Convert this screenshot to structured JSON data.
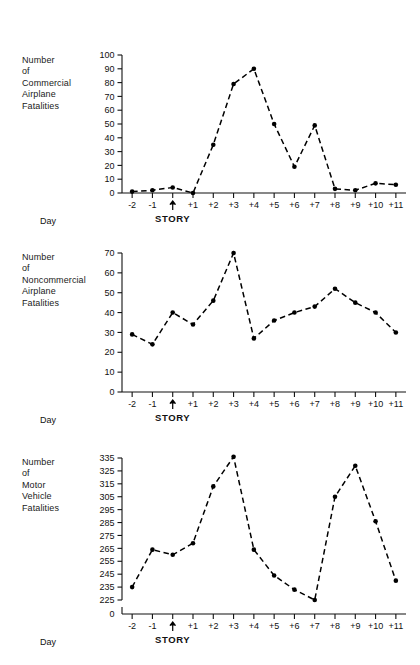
{
  "figure": {
    "x_axis_title": "Day",
    "story_marker_label": "STORY",
    "story_marker_icon": "up-arrow-icon",
    "categories": [
      "-2",
      "-1",
      "0",
      "+1",
      "+2",
      "+3",
      "+4",
      "+5",
      "+6",
      "+7",
      "+8",
      "+9",
      "+10",
      "+11"
    ],
    "tick_labels": [
      "-2",
      "-1",
      "↑",
      "+1",
      "+2",
      "+3",
      "+4",
      "+5",
      "+6",
      "+7",
      "+8",
      "+9",
      "+10",
      "+11"
    ],
    "line_color": "#000000",
    "marker_color": "#000000",
    "axis_color": "#111111",
    "background": "#ffffff"
  },
  "chart_data": [
    {
      "type": "line",
      "id": "commercial-airplane-fatalities",
      "title": "",
      "ylabel_lines": [
        "Number",
        "of",
        "Commercial",
        "Airplane",
        "Fatalities"
      ],
      "ylabel": "Number of Commercial Airplane Fatalities",
      "xlabel": "Day",
      "categories": [
        "-2",
        "-1",
        "0",
        "+1",
        "+2",
        "+3",
        "+4",
        "+5",
        "+6",
        "+7",
        "+8",
        "+9",
        "+10",
        "+11"
      ],
      "values": [
        1,
        2,
        4,
        0,
        35,
        79,
        90,
        50,
        19,
        49,
        3,
        2,
        7,
        6
      ],
      "yticks": [
        0,
        10,
        20,
        30,
        40,
        50,
        60,
        70,
        80,
        90,
        100
      ],
      "ytick_labels": [
        "0",
        "10",
        "20",
        "30",
        "40",
        "50",
        "60",
        "70",
        "80",
        "90",
        "100"
      ],
      "ylim": [
        0,
        100
      ],
      "axis_break": false,
      "grid": false,
      "legend": "none",
      "linestyle": "dashed",
      "annotations": [
        {
          "x": "0",
          "text": "STORY",
          "marker": "up-arrow-icon"
        }
      ]
    },
    {
      "type": "line",
      "id": "noncommercial-airplane-fatalities",
      "title": "",
      "ylabel_lines": [
        "Number",
        "of",
        "Noncommercial",
        "Airplane",
        "Fatalities"
      ],
      "ylabel": "Number of Noncommercial Airplane Fatalities",
      "xlabel": "Day",
      "categories": [
        "-2",
        "-1",
        "0",
        "+1",
        "+2",
        "+3",
        "+4",
        "+5",
        "+6",
        "+7",
        "+8",
        "+9",
        "+10",
        "+11"
      ],
      "values": [
        29,
        24,
        40,
        34,
        46,
        70,
        27,
        36,
        40,
        43,
        52,
        45,
        40,
        30
      ],
      "yticks": [
        0,
        10,
        20,
        30,
        40,
        50,
        60,
        70
      ],
      "ytick_labels": [
        "0",
        "10",
        "20",
        "30",
        "40",
        "50",
        "60",
        "70"
      ],
      "ylim": [
        0,
        70
      ],
      "axis_break": false,
      "grid": false,
      "legend": "none",
      "linestyle": "dashed",
      "annotations": [
        {
          "x": "0",
          "text": "STORY",
          "marker": "up-arrow-icon"
        }
      ]
    },
    {
      "type": "line",
      "id": "motor-vehicle-fatalities",
      "title": "",
      "ylabel_lines": [
        "Number",
        "of",
        "Motor",
        "Vehicle",
        "Fatalities"
      ],
      "ylabel": "Number of Motor Vehicle Fatalities",
      "xlabel": "Day",
      "categories": [
        "-2",
        "-1",
        "0",
        "+1",
        "+2",
        "+3",
        "+4",
        "+5",
        "+6",
        "+7",
        "+8",
        "+9",
        "+10",
        "+11"
      ],
      "values": [
        235,
        264,
        260,
        269,
        313,
        336,
        264,
        244,
        233,
        225,
        305,
        329,
        286,
        240
      ],
      "yticks": [
        225,
        235,
        245,
        255,
        265,
        275,
        285,
        295,
        305,
        315,
        325,
        335
      ],
      "ytick_labels": [
        "225",
        "235",
        "245",
        "255",
        "265",
        "275",
        "285",
        "295",
        "305",
        "315",
        "325",
        "335"
      ],
      "origin_label": "0",
      "ylim": [
        225,
        335
      ],
      "axis_break": true,
      "grid": false,
      "legend": "none",
      "linestyle": "dashed",
      "annotations": [
        {
          "x": "0",
          "text": "STORY",
          "marker": "up-arrow-icon"
        }
      ]
    }
  ]
}
